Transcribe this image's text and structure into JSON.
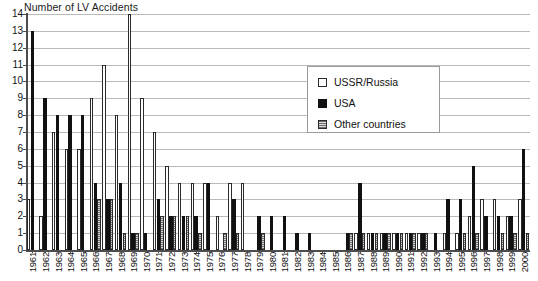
{
  "chart_data": {
    "type": "bar",
    "title": "Number of LV Accidents",
    "xlabel": "",
    "ylabel": "",
    "ylim": [
      0,
      14
    ],
    "ytick_step": 1,
    "yticks": [
      0,
      1,
      2,
      3,
      4,
      5,
      6,
      7,
      8,
      9,
      10,
      11,
      12,
      13,
      14
    ],
    "grid": true,
    "grid_axis": "y",
    "legend_position": "inside-upper-right",
    "categories": [
      "1961",
      "1962",
      "1963",
      "1964",
      "1965",
      "1966",
      "1967",
      "1968",
      "1969",
      "1970",
      "1971",
      "1972",
      "1973",
      "1974",
      "1975",
      "1976",
      "1977",
      "1978",
      "1979",
      "1980",
      "1981",
      "1982",
      "1983",
      "1984",
      "1985",
      "1986",
      "1987",
      "1988",
      "1989",
      "1990",
      "1991",
      "1992",
      "1993",
      "1994",
      "1995",
      "1996",
      "1997",
      "1998",
      "1999",
      "2000"
    ],
    "series": [
      {
        "name": "USSR/Russia",
        "color": "#ffffff",
        "edge_color": "#2b2b2b",
        "values": [
          3,
          2,
          7,
          6,
          6,
          9,
          11,
          8,
          14,
          9,
          7,
          5,
          4,
          4,
          4,
          2,
          4,
          4,
          0,
          0,
          0,
          0,
          0,
          0,
          0,
          0,
          1,
          1,
          1,
          1,
          1,
          1,
          0,
          1,
          1,
          2,
          3,
          3,
          2,
          3
        ]
      },
      {
        "name": "USA",
        "color": "#111111",
        "edge_color": "#111111",
        "values": [
          13,
          9,
          8,
          8,
          8,
          4,
          3,
          4,
          1,
          1,
          3,
          2,
          2,
          2,
          4,
          0,
          3,
          0,
          2,
          2,
          2,
          1,
          1,
          0,
          0,
          1,
          4,
          1,
          1,
          1,
          1,
          1,
          1,
          3,
          3,
          5,
          2,
          2,
          2,
          6
        ]
      },
      {
        "name": "Other countries",
        "color": "#8a8a8a",
        "edge_color": "#2b2b2b",
        "values": [
          0,
          0,
          0,
          0,
          0,
          3,
          3,
          1,
          1,
          0,
          2,
          2,
          2,
          1,
          0,
          1,
          1,
          0,
          1,
          0,
          0,
          0,
          0,
          0,
          0,
          1,
          1,
          1,
          1,
          1,
          1,
          1,
          0,
          0,
          1,
          1,
          0,
          1,
          1,
          1
        ]
      }
    ]
  },
  "legend": {
    "items": [
      {
        "label": "USSR/Russia",
        "swatch": "ussr"
      },
      {
        "label": "USA",
        "swatch": "usa"
      },
      {
        "label": "Other countries",
        "swatch": "other"
      }
    ]
  }
}
